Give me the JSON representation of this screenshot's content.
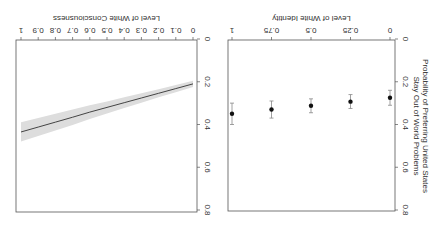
{
  "figure": {
    "orientation": "rotated-180",
    "shared_ylabel_line1": "Probability of Preferring United States",
    "shared_ylabel_line2": "Stay Out of World Problems"
  },
  "chart_data": [
    {
      "type": "scatter",
      "title": "",
      "xlabel": "Level of White Identity",
      "ylabel": "Probability of Preferring United States Stay Out of World Problems",
      "xlim": [
        0,
        1
      ],
      "ylim": [
        0,
        0.8
      ],
      "xticks": [
        "0",
        "0.25",
        "0.5",
        "0.75",
        "1"
      ],
      "xtick_values": [
        0,
        0.25,
        0.5,
        0.75,
        1
      ],
      "yticks": [
        "0",
        "0.2",
        "0.4",
        "0.6",
        "0.8"
      ],
      "ytick_values": [
        0,
        0.2,
        0.4,
        0.6,
        0.8
      ],
      "grid": false,
      "points": [
        {
          "x": 0,
          "y": 0.275,
          "lo": 0.24,
          "hi": 0.31
        },
        {
          "x": 0.25,
          "y": 0.293,
          "lo": 0.26,
          "hi": 0.325
        },
        {
          "x": 0.5,
          "y": 0.312,
          "lo": 0.28,
          "hi": 0.345
        },
        {
          "x": 0.75,
          "y": 0.33,
          "lo": 0.29,
          "hi": 0.37
        },
        {
          "x": 1,
          "y": 0.35,
          "lo": 0.3,
          "hi": 0.4
        }
      ]
    },
    {
      "type": "line",
      "title": "",
      "xlabel": "Level of White Consciousness",
      "ylabel": "Probability of Preferring United States Stay Out of World Problems",
      "xlim": [
        0,
        1
      ],
      "ylim": [
        0,
        0.8
      ],
      "xticks": [
        "0",
        "0.1",
        "0.2",
        "0.3",
        "0.4",
        "0.5",
        "0.6",
        "0.7",
        "0.8",
        "0.9",
        "1"
      ],
      "xtick_values": [
        0,
        0.1,
        0.2,
        0.3,
        0.4,
        0.5,
        0.6,
        0.7,
        0.8,
        0.9,
        1
      ],
      "yticks": [
        "0",
        "0.2",
        "0.4",
        "0.6",
        "0.8"
      ],
      "ytick_values": [
        0,
        0.2,
        0.4,
        0.6,
        0.8
      ],
      "grid": false,
      "series": [
        {
          "name": "predicted probability",
          "x": [
            0,
            0.1,
            0.2,
            0.3,
            0.4,
            0.5,
            0.6,
            0.7,
            0.8,
            0.9,
            1
          ],
          "y": [
            0.21,
            0.232,
            0.254,
            0.276,
            0.298,
            0.32,
            0.342,
            0.366,
            0.389,
            0.412,
            0.435
          ],
          "lo": [
            0.195,
            0.215,
            0.235,
            0.254,
            0.273,
            0.292,
            0.31,
            0.33,
            0.35,
            0.37,
            0.39
          ],
          "hi": [
            0.225,
            0.249,
            0.273,
            0.298,
            0.323,
            0.348,
            0.374,
            0.402,
            0.428,
            0.454,
            0.48
          ]
        }
      ]
    }
  ]
}
